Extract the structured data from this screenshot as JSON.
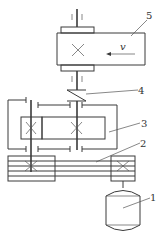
{
  "diagram": {
    "type": "mechanical-transmission-schematic",
    "labels": [
      {
        "id": "1",
        "text": "1",
        "component": "motor"
      },
      {
        "id": "2",
        "text": "2",
        "component": "belt-drive"
      },
      {
        "id": "3",
        "text": "3",
        "component": "gear-reducer"
      },
      {
        "id": "4",
        "text": "4",
        "component": "coupling"
      },
      {
        "id": "5",
        "text": "5",
        "component": "conveyor-drum"
      }
    ],
    "velocity_label": "v",
    "colors": {
      "line": "#3a3a3a",
      "background": "#ffffff"
    }
  }
}
